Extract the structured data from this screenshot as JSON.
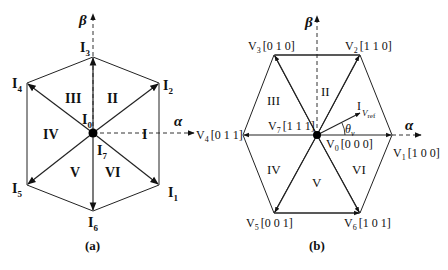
{
  "figure_a": {
    "caption": "(a)",
    "axes": {
      "alpha": "α",
      "beta": "β"
    },
    "vectors": [
      {
        "id": "I1",
        "base": "I",
        "sub": "1"
      },
      {
        "id": "I2",
        "base": "I",
        "sub": "2"
      },
      {
        "id": "I3",
        "base": "I",
        "sub": "3"
      },
      {
        "id": "I4",
        "base": "I",
        "sub": "4"
      },
      {
        "id": "I5",
        "base": "I",
        "sub": "5"
      },
      {
        "id": "I6",
        "base": "I",
        "sub": "6"
      }
    ],
    "zero_vectors": [
      {
        "id": "I0",
        "base": "I",
        "sub": "0"
      },
      {
        "id": "I7",
        "base": "I",
        "sub": "7"
      }
    ],
    "sectors": [
      "I",
      "II",
      "III",
      "IV",
      "V",
      "VI"
    ]
  },
  "figure_b": {
    "caption": "(b)",
    "axes": {
      "alpha": "α",
      "beta": "β"
    },
    "vectors": [
      {
        "id": "V1",
        "base": "V",
        "sub": "1",
        "state": "[1 0 0]"
      },
      {
        "id": "V2",
        "base": "V",
        "sub": "2",
        "state": "[1 1 0]"
      },
      {
        "id": "V3",
        "base": "V",
        "sub": "3",
        "state": "[0 1 0]"
      },
      {
        "id": "V4",
        "base": "V",
        "sub": "4",
        "state": "[0 1 1]"
      },
      {
        "id": "V5",
        "base": "V",
        "sub": "5",
        "state": "[0 0 1]"
      },
      {
        "id": "V6",
        "base": "V",
        "sub": "6",
        "state": "[1 0 1]"
      }
    ],
    "zero_vectors": [
      {
        "id": "V0",
        "base": "V",
        "sub": "0",
        "state": "[0 0 0]"
      },
      {
        "id": "V7",
        "base": "V",
        "sub": "7",
        "state": "[1 1 1]"
      }
    ],
    "sectors": [
      "I",
      "II",
      "III",
      "IV",
      "V",
      "VI"
    ],
    "reference": {
      "base": "V",
      "sub": "ref",
      "angle_base": "θ",
      "angle_sub": "v"
    }
  }
}
